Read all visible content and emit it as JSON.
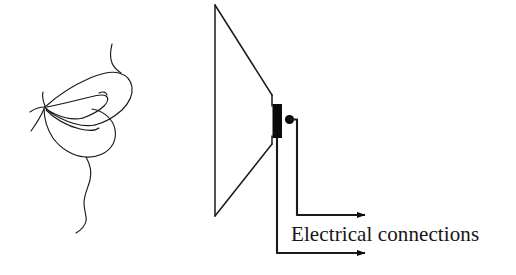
{
  "figure": {
    "background_color": "#ffffff",
    "ink_color": "#1a1a1a",
    "width": 516,
    "height": 275
  },
  "labels": {
    "electrical_connections": "Electrical connections"
  },
  "diagram": {
    "moth": {
      "name": "moth-drawing",
      "description": "hand drawn moth with wings, antenna and curled tail",
      "parts": [
        "upper-wing",
        "lower-wing",
        "inner-wing-fold",
        "antenna",
        "legs",
        "tail-curl"
      ]
    },
    "loudspeaker": {
      "name": "loudspeaker-cone",
      "cone_label": "speaker cone",
      "voice_coil_label": "voice coil",
      "terminal_label": "terminal dot",
      "cone_color": "#1a1a1a",
      "coil_color": "#0b0b0b"
    },
    "wires": {
      "upper_wire_label": "upper connection wire",
      "lower_wire_label": "lower connection wire",
      "arrow_count": 2
    }
  }
}
